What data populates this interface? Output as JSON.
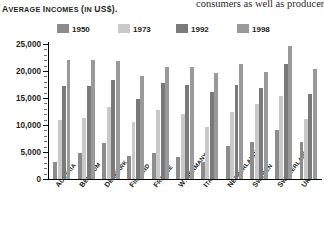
{
  "runninghead": "consumers as well as producers",
  "chart_title_lead": "A",
  "chart_title": "VERAGE ",
  "chart": {
    "title": "AVERAGE INCOMES (IN US$).",
    "title_parts": {
      "a": "A",
      "verage": "VERAGE ",
      "i": "I",
      "ncomes": "NCOMES ",
      "paren": "(",
      "in": "IN ",
      "us": "US$",
      "close": ")."
    }
  },
  "legend": {
    "items": [
      {
        "label": "1950",
        "color": "#8c8c8c"
      },
      {
        "label": "1973",
        "color": "#c9c9c9"
      },
      {
        "label": "1992",
        "color": "#7a7a7a"
      },
      {
        "label": "1998",
        "color": "#9a9a9a"
      }
    ]
  },
  "yaxis": {
    "ticks": [
      "0",
      "5,000",
      "10,000",
      "15,000",
      "20,000",
      "25,000"
    ]
  },
  "chart_data": {
    "type": "bar",
    "title": "AVERAGE INCOMES (IN US$).",
    "xlabel": "",
    "ylabel": "",
    "ylim": [
      0,
      25000
    ],
    "yticks": [
      0,
      5000,
      10000,
      15000,
      20000,
      25000
    ],
    "grid": false,
    "legend_position": "top",
    "categories": [
      "AUSTRIA",
      "BELGIUM",
      "DENMARK",
      "FINLAND",
      "FRANCE",
      "W. GERMANY",
      "ITALY",
      "NETHERLANDS",
      "SWEDEN",
      "SWITZERLAND",
      "UK"
    ],
    "series": [
      {
        "name": "1950",
        "color": "#8c8c8c",
        "values": [
          3100,
          4900,
          6700,
          4300,
          4900,
          4100,
          3100,
          6200,
          6900,
          9000,
          6900
        ]
      },
      {
        "name": "1973",
        "color": "#c9c9c9",
        "values": [
          11000,
          11300,
          13300,
          10500,
          12700,
          12000,
          9700,
          12400,
          13800,
          15300,
          11200
        ]
      },
      {
        "name": "1992",
        "color": "#7a7a7a",
        "values": [
          17300,
          17200,
          18300,
          14800,
          17800,
          17500,
          16200,
          17400,
          16900,
          21300,
          15800
        ]
      },
      {
        "name": "1998",
        "color": "#9a9a9a",
        "values": [
          22000,
          22100,
          21800,
          19000,
          20700,
          20800,
          19700,
          21300,
          19800,
          24600,
          20300
        ]
      }
    ]
  }
}
